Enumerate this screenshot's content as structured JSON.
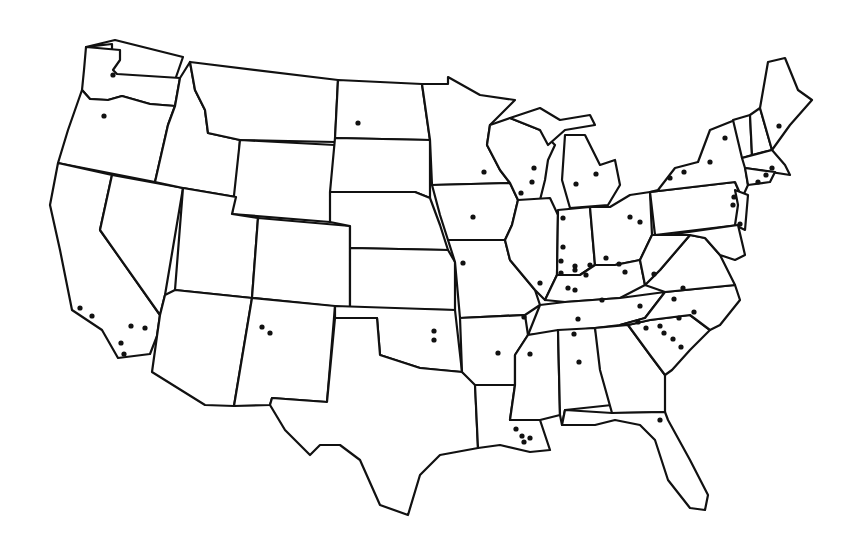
{
  "map": {
    "title": "United States outline map with location dots",
    "colors": {
      "background": "#ffffff",
      "outline": "#111111",
      "dot": "#111111"
    },
    "dots": [
      [
        113,
        75
      ],
      [
        104,
        116
      ],
      [
        80,
        308
      ],
      [
        92,
        316
      ],
      [
        131,
        326
      ],
      [
        145,
        328
      ],
      [
        121,
        343
      ],
      [
        124,
        354
      ],
      [
        262,
        327
      ],
      [
        270,
        333
      ],
      [
        358,
        123
      ],
      [
        484,
        172
      ],
      [
        473,
        217
      ],
      [
        534,
        168
      ],
      [
        532,
        182
      ],
      [
        521,
        193
      ],
      [
        576,
        184
      ],
      [
        596,
        174
      ],
      [
        563,
        218
      ],
      [
        563,
        247
      ],
      [
        463,
        263
      ],
      [
        540,
        283
      ],
      [
        524,
        317
      ],
      [
        561,
        261
      ],
      [
        575,
        266
      ],
      [
        586,
        275
      ],
      [
        606,
        258
      ],
      [
        670,
        178
      ],
      [
        684,
        172
      ],
      [
        710,
        162
      ],
      [
        725,
        138
      ],
      [
        779,
        126
      ],
      [
        766,
        175
      ],
      [
        758,
        182
      ],
      [
        772,
        168
      ],
      [
        734,
        197
      ],
      [
        733,
        205
      ],
      [
        740,
        224
      ],
      [
        630,
        217
      ],
      [
        640,
        222
      ],
      [
        654,
        274
      ],
      [
        561,
        273
      ],
      [
        575,
        270
      ],
      [
        568,
        288
      ],
      [
        590,
        265
      ],
      [
        575,
        290
      ],
      [
        602,
        300
      ],
      [
        619,
        264
      ],
      [
        625,
        272
      ],
      [
        578,
        319
      ],
      [
        574,
        334
      ],
      [
        640,
        306
      ],
      [
        660,
        326
      ],
      [
        674,
        299
      ],
      [
        683,
        288
      ],
      [
        694,
        312
      ],
      [
        638,
        322
      ],
      [
        646,
        328
      ],
      [
        679,
        318
      ],
      [
        664,
        333
      ],
      [
        673,
        339
      ],
      [
        681,
        347
      ],
      [
        498,
        353
      ],
      [
        530,
        354
      ],
      [
        579,
        362
      ],
      [
        434,
        331
      ],
      [
        434,
        340
      ],
      [
        660,
        420
      ],
      [
        516,
        429
      ],
      [
        522,
        436
      ],
      [
        524,
        442
      ],
      [
        530,
        438
      ]
    ]
  }
}
